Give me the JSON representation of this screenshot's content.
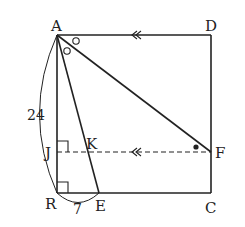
{
  "figure": {
    "type": "geometry-diagram",
    "shape": "square ABCD with segments AE, AF and dashed line JF"
  },
  "points": {
    "A": {
      "label": "A",
      "x": 57,
      "y": 35
    },
    "D": {
      "label": "D",
      "x": 211,
      "y": 35
    },
    "B": {
      "label": "R",
      "x": 57,
      "y": 193
    },
    "C": {
      "label": "C",
      "x": 211,
      "y": 193
    },
    "E": {
      "label": "E",
      "x": 99,
      "y": 193
    },
    "F": {
      "label": "F",
      "x": 211,
      "y": 152
    },
    "J": {
      "label": "J",
      "x": 57,
      "y": 152
    },
    "K": {
      "label": "K",
      "x": 88,
      "y": 152
    }
  },
  "measurements": {
    "AB": "24",
    "BE": "7"
  },
  "annotations": {
    "parallel_marks": "double arrow on AD and JF",
    "equal_angles": "circle marks at A (angle BAE... EAF split)",
    "angle_dot": "dot at F",
    "right_angles": [
      "J",
      "B"
    ]
  },
  "colors": {
    "line": "#222222",
    "background": "#ffffff"
  }
}
